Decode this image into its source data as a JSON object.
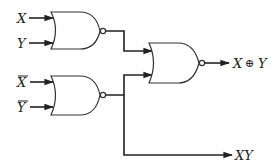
{
  "diagram": {
    "title": "",
    "type": "logic-circuit",
    "inputs": [
      {
        "id": "x",
        "label": "X",
        "overbar": false
      },
      {
        "id": "y",
        "label": "Y",
        "overbar": false
      },
      {
        "id": "xbar",
        "label": "X",
        "overbar": true
      },
      {
        "id": "ybar",
        "label": "Y",
        "overbar": true
      }
    ],
    "gates": [
      {
        "id": "g1",
        "type": "NOR",
        "inputs": [
          "X",
          "Y"
        ]
      },
      {
        "id": "g2",
        "type": "NOR",
        "inputs": [
          "X̄",
          "Ȳ"
        ]
      },
      {
        "id": "g3",
        "type": "NOR",
        "inputs": [
          "g1",
          "g2"
        ]
      }
    ],
    "outputs": [
      {
        "id": "xor",
        "label_left": "X",
        "operator": "⊕",
        "label_right": "Y"
      },
      {
        "id": "and",
        "label": "XY"
      }
    ],
    "colors": {
      "line": "#222222",
      "background": "#ffffff"
    }
  }
}
